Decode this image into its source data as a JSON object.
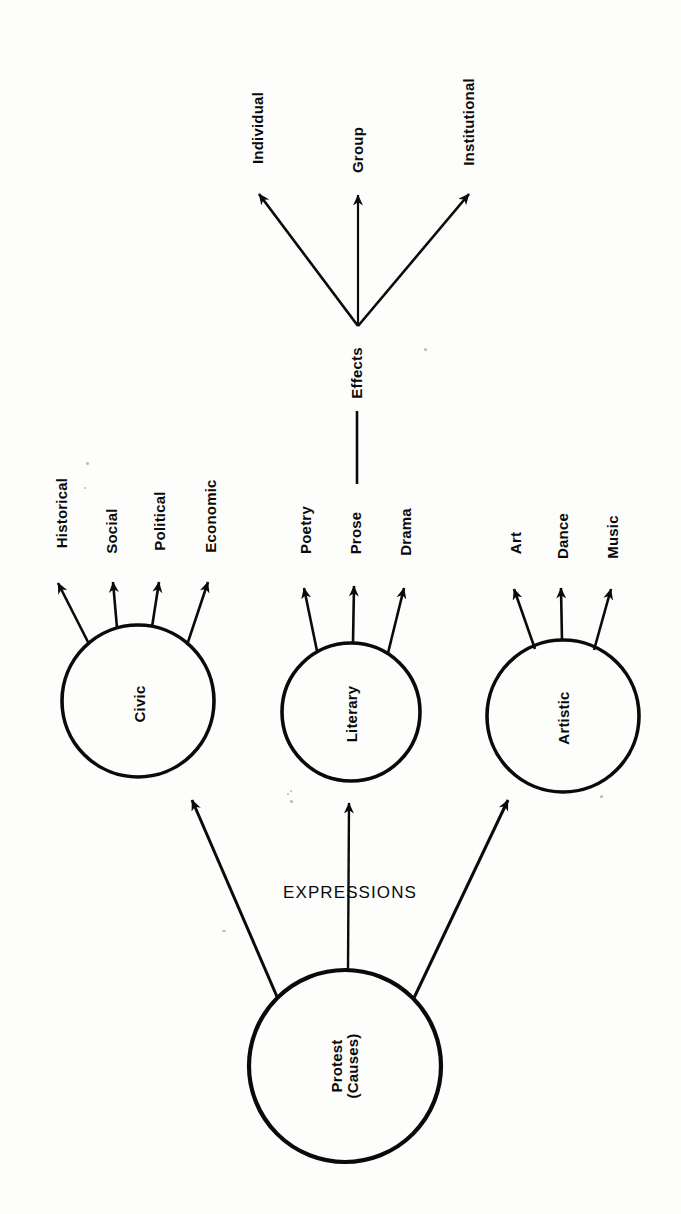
{
  "diagram": {
    "orientation": "rotated-90-ccw",
    "ink_color": "#0a0a0a",
    "paper_color": "#fdfdfc",
    "root": {
      "id": "protest",
      "label_line1": "Protest",
      "label_line2": "(Causes)",
      "shape": "circle"
    },
    "edge_labels": {
      "expressions": "EXPRESSIONS",
      "effects": "Effects"
    },
    "expression_nodes": [
      {
        "id": "civic",
        "label": "Civic",
        "branches": [
          "Historical",
          "Social",
          "Political",
          "Economic"
        ]
      },
      {
        "id": "literary",
        "label": "Literary",
        "branches": [
          "Poetry",
          "Prose",
          "Drama"
        ]
      },
      {
        "id": "artistic",
        "label": "Artistic",
        "branches": [
          "Art",
          "Dance",
          "Music"
        ]
      }
    ],
    "effect_branches": [
      "Individual",
      "Group",
      "Institutional"
    ]
  }
}
